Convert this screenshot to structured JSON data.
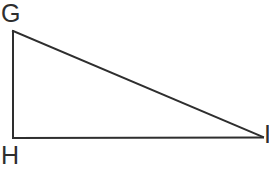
{
  "figure": {
    "kind": "right-triangle-diagram",
    "background_color": "#ffffff",
    "stroke_color": "#2e2e2e",
    "stroke_width": 2,
    "fill": "none",
    "canvas": {
      "width": 269,
      "height": 169
    },
    "vertices": [
      {
        "id": "G",
        "label": "G",
        "x": 13,
        "y": 31,
        "label_x": 1,
        "label_y": 1,
        "clipped": false
      },
      {
        "id": "H",
        "label": "H",
        "x": 13,
        "y": 138,
        "label_x": 1,
        "label_y": 143,
        "clipped": false
      },
      {
        "id": "I",
        "label": "I",
        "x": 262,
        "y": 137,
        "label_x": 264,
        "label_y": 122,
        "clipped": true
      }
    ],
    "edges": [
      {
        "id": "GH",
        "from": "G",
        "to": "H",
        "role": "vertical-leg"
      },
      {
        "id": "HI",
        "from": "H",
        "to": "I",
        "role": "horizontal-leg"
      },
      {
        "id": "GI",
        "from": "G",
        "to": "I",
        "role": "hypotenuse"
      }
    ],
    "right_angle_at": "H"
  }
}
